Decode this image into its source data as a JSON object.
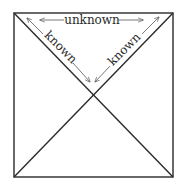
{
  "diagram": {
    "labels": {
      "top": "unknown",
      "left_diagonal": "known",
      "right_diagonal": "known"
    },
    "colors": {
      "stroke": "#2a2a2a",
      "arrow": "#6a6a6a",
      "background": "#ffffff"
    }
  }
}
